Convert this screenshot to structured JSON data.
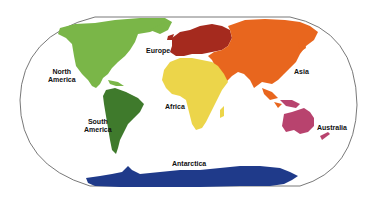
{
  "map": {
    "type": "world-continents",
    "projection": "oval",
    "background": "#ffffff",
    "border_color": "#555555",
    "continents": [
      {
        "id": "north-america",
        "label_lines": [
          "North",
          "America"
        ],
        "color": "#7ab648"
      },
      {
        "id": "south-america",
        "label_lines": [
          "South",
          "America"
        ],
        "color": "#3f7a2c"
      },
      {
        "id": "europe",
        "label_lines": [
          "Europe"
        ],
        "color": "#a52a1e"
      },
      {
        "id": "asia",
        "label_lines": [
          "Asia"
        ],
        "color": "#e8661e"
      },
      {
        "id": "africa",
        "label_lines": [
          "Africa"
        ],
        "color": "#ecd54a"
      },
      {
        "id": "australia",
        "label_lines": [
          "Australia"
        ],
        "color": "#b8436e"
      },
      {
        "id": "antarctica",
        "label_lines": [
          "Antarctica"
        ],
        "color": "#1f3a8a"
      }
    ]
  }
}
